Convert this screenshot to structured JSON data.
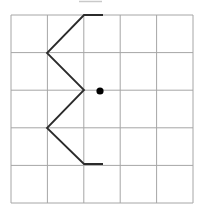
{
  "figure": {
    "canvas": {
      "width": 205,
      "height": 213,
      "background": "#ffffff"
    },
    "grid": {
      "left": 11,
      "top": 15,
      "right": 193,
      "bottom": 203,
      "columns": 5,
      "rows": 5,
      "line_color": "#a6a6a6",
      "line_width": 1
    },
    "zigzag": {
      "points": [
        [
          103,
          15
        ],
        [
          84,
          15
        ],
        [
          47,
          53
        ],
        [
          84,
          90
        ],
        [
          47,
          128
        ],
        [
          84,
          164
        ],
        [
          103,
          164
        ]
      ],
      "color": "#2b2b2b",
      "width": 1.8
    },
    "dot": {
      "cx": 100,
      "cy": 91,
      "r": 3.6,
      "color": "#000000"
    },
    "top_edge_artifact": {
      "x1": 79,
      "y1": 1.5,
      "x2": 102,
      "y2": 1.5,
      "color": "#c9c9c9",
      "width": 1.5
    }
  }
}
